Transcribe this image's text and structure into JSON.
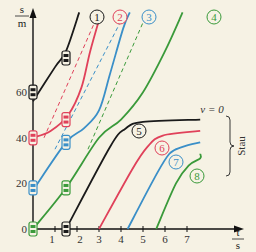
{
  "chart_data": {
    "type": "line",
    "title": "",
    "xlabel": "t/s",
    "ylabel": "s/m",
    "x_ticks": [
      1,
      2,
      3,
      4,
      5,
      6,
      7
    ],
    "y_ticks": [
      0,
      20,
      40,
      60
    ],
    "xlim": [
      0,
      8.5
    ],
    "ylim": [
      0,
      95
    ],
    "annotations": {
      "v0": "v = 0",
      "jam": "Stau"
    },
    "colors": {
      "black": "#1a1a1a",
      "red": "#e0415a",
      "blue": "#3a8fc8",
      "green": "#3a9a3a"
    },
    "series": [
      {
        "name": "1",
        "color": "#1a1a1a",
        "style": "solid",
        "points": [
          [
            0,
            56
          ],
          [
            1,
            71
          ],
          [
            1.5,
            78
          ],
          [
            2.1,
            95
          ]
        ]
      },
      {
        "name": "2",
        "color": "#e0415a",
        "style": "solid",
        "points": [
          [
            0,
            40
          ],
          [
            0.8,
            43
          ],
          [
            1.6,
            50
          ],
          [
            2.2,
            62
          ],
          [
            2.6,
            78
          ],
          [
            3.1,
            95
          ]
        ]
      },
      {
        "name": "2 (dashed)",
        "color": "#e0415a",
        "style": "dashed",
        "points": [
          [
            0.5,
            40
          ],
          [
            3.0,
            95
          ]
        ]
      },
      {
        "name": "3",
        "color": "#3a8fc8",
        "style": "solid",
        "points": [
          [
            0,
            17
          ],
          [
            1.5,
            38
          ],
          [
            2.3,
            44
          ],
          [
            3.0,
            52
          ],
          [
            3.5,
            68
          ],
          [
            4.1,
            88
          ],
          [
            4.4,
            95
          ]
        ]
      },
      {
        "name": "3 (dashed)",
        "color": "#3a8fc8",
        "style": "dashed",
        "points": [
          [
            1.0,
            35
          ],
          [
            4.2,
            95
          ]
        ]
      },
      {
        "name": "4",
        "color": "#3a9a3a",
        "style": "solid",
        "points": [
          [
            0,
            0
          ],
          [
            1.5,
            18
          ],
          [
            3.0,
            40
          ],
          [
            4.0,
            48
          ],
          [
            5.0,
            60
          ],
          [
            6.0,
            78
          ],
          [
            6.8,
            95
          ]
        ]
      },
      {
        "name": "4 (dashed)",
        "color": "#3a9a3a",
        "style": "dashed",
        "points": [
          [
            2.5,
            35
          ],
          [
            5.2,
            95
          ]
        ]
      },
      {
        "name": "5",
        "color": "#1a1a1a",
        "style": "solid",
        "points": [
          [
            1.5,
            0
          ],
          [
            3.5,
            36
          ],
          [
            4.2,
            44
          ],
          [
            5.0,
            47
          ],
          [
            7.6,
            48
          ]
        ]
      },
      {
        "name": "6",
        "color": "#e0415a",
        "style": "solid",
        "points": [
          [
            3.0,
            0
          ],
          [
            4.5,
            26
          ],
          [
            5.2,
            36
          ],
          [
            5.9,
            41
          ],
          [
            7.6,
            43
          ]
        ]
      },
      {
        "name": "7",
        "color": "#3a8fc8",
        "style": "solid",
        "points": [
          [
            4.3,
            0
          ],
          [
            5.5,
            22
          ],
          [
            6.2,
            33
          ],
          [
            6.8,
            36
          ],
          [
            7.6,
            38
          ]
        ]
      },
      {
        "name": "8",
        "color": "#3a9a3a",
        "style": "solid",
        "points": [
          [
            5.6,
            0
          ],
          [
            6.5,
            20
          ],
          [
            7.1,
            28
          ],
          [
            7.6,
            31
          ],
          [
            7.6,
            33
          ]
        ]
      }
    ],
    "car_icons": [
      {
        "color": "#1a1a1a",
        "t": 0,
        "s": 60
      },
      {
        "color": "#1a1a1a",
        "t": 1.5,
        "s": 75
      },
      {
        "color": "#e0415a",
        "t": 0,
        "s": 40
      },
      {
        "color": "#e0415a",
        "t": 1.5,
        "s": 48
      },
      {
        "color": "#3a8fc8",
        "t": 0,
        "s": 18
      },
      {
        "color": "#3a8fc8",
        "t": 1.5,
        "s": 38
      },
      {
        "color": "#3a9a3a",
        "t": 0,
        "s": 0
      },
      {
        "color": "#3a9a3a",
        "t": 1.5,
        "s": 18
      },
      {
        "color": "#1a1a1a",
        "t": 1.5,
        "s": 0
      }
    ]
  }
}
